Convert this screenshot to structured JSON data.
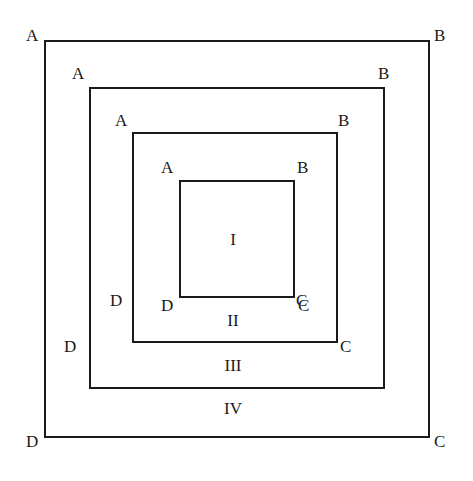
{
  "figure": {
    "background_color": "#ffffff",
    "line_color": "#1a1a1a",
    "width": 473,
    "height": 481
  },
  "squares": [
    {
      "id": "I",
      "name": "innermost-square",
      "vertices": {
        "a": "A",
        "b": "B",
        "c": "C",
        "d": "D"
      },
      "x": 179,
      "y": 180,
      "width": 116,
      "height": 118
    },
    {
      "id": "II",
      "name": "third-square",
      "vertices": {
        "a": "A",
        "b": "B",
        "c": "C",
        "d": "D"
      },
      "x": 132,
      "y": 132,
      "width": 206,
      "height": 211
    },
    {
      "id": "III",
      "name": "second-square",
      "vertices": {
        "a": "A",
        "b": "B",
        "c": "C",
        "d": "D"
      },
      "x": 89,
      "y": 87,
      "width": 296,
      "height": 302
    },
    {
      "id": "IV",
      "name": "outer-square",
      "vertices": {
        "a": "A",
        "b": "B",
        "c": "C",
        "d": "D"
      },
      "x": 44,
      "y": 40,
      "width": 386,
      "height": 398
    }
  ],
  "regions": [
    {
      "label": "I",
      "name": "region-one"
    },
    {
      "label": "II",
      "name": "region-two"
    },
    {
      "label": "III",
      "name": "region-three"
    },
    {
      "label": "IV",
      "name": "region-four"
    }
  ]
}
